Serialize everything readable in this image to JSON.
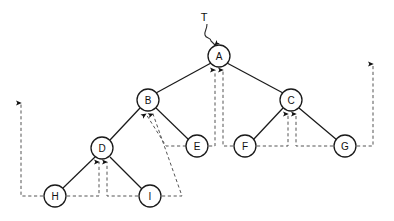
{
  "diagram": {
    "root_pointer_label": "T",
    "colors": {
      "node_stroke": "#1a1a1a",
      "node_fill": "#ffffff",
      "edge": "#1a1a1a",
      "thread": "#555555",
      "text": "#111111",
      "background": "#ffffff"
    },
    "node_radius": 11,
    "nodes": [
      {
        "id": "A",
        "label": "A",
        "x": 219,
        "y": 56
      },
      {
        "id": "B",
        "label": "B",
        "x": 148,
        "y": 100
      },
      {
        "id": "C",
        "label": "C",
        "x": 291,
        "y": 100
      },
      {
        "id": "D",
        "label": "D",
        "x": 102,
        "y": 148
      },
      {
        "id": "E",
        "label": "E",
        "x": 197,
        "y": 146
      },
      {
        "id": "F",
        "label": "F",
        "x": 245,
        "y": 146
      },
      {
        "id": "G",
        "label": "G",
        "x": 345,
        "y": 146
      },
      {
        "id": "H",
        "label": "H",
        "x": 55,
        "y": 196
      },
      {
        "id": "I",
        "label": "I",
        "x": 150,
        "y": 196
      }
    ],
    "edges": [
      {
        "from": "A",
        "to": "B"
      },
      {
        "from": "A",
        "to": "C"
      },
      {
        "from": "B",
        "to": "D"
      },
      {
        "from": "B",
        "to": "E"
      },
      {
        "from": "C",
        "to": "F"
      },
      {
        "from": "C",
        "to": "G"
      },
      {
        "from": "D",
        "to": "H"
      },
      {
        "from": "D",
        "to": "I"
      }
    ],
    "threads": [
      {
        "id": "thread-e-to-a",
        "from": "E",
        "to": "A",
        "kind": "successor"
      },
      {
        "id": "thread-f-to-a",
        "from": "F",
        "to": "A",
        "kind": "predecessor"
      },
      {
        "id": "thread-e-to-b",
        "from": "E",
        "to": "B",
        "kind": "successor"
      },
      {
        "id": "thread-i-to-b",
        "from": "I",
        "to": "B",
        "kind": "successor"
      },
      {
        "id": "thread-f-to-c",
        "from": "F",
        "to": "C",
        "kind": "successor"
      },
      {
        "id": "thread-g-to-c",
        "from": "G",
        "to": "C",
        "kind": "predecessor"
      },
      {
        "id": "thread-h-to-d",
        "from": "H",
        "to": "D",
        "kind": "successor"
      },
      {
        "id": "thread-i-to-d",
        "from": "I",
        "to": "D",
        "kind": "predecessor"
      },
      {
        "id": "thread-h-to-head-left",
        "from": "H",
        "to": "head",
        "kind": "list-head"
      },
      {
        "id": "thread-g-to-head-right",
        "from": "G",
        "to": "head",
        "kind": "list-head"
      }
    ]
  }
}
